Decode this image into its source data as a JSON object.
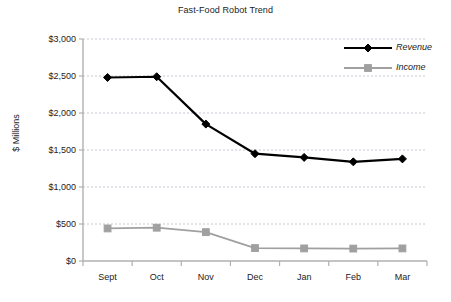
{
  "chart_data": {
    "type": "line",
    "title": "Fast-Food Robot Trend",
    "xlabel": "",
    "ylabel": "$ Millions",
    "categories": [
      "Sept",
      "Oct",
      "Nov",
      "Dec",
      "Jan",
      "Feb",
      "Mar"
    ],
    "series": [
      {
        "name": "Revenue",
        "values": [
          2480,
          2490,
          1850,
          1450,
          1400,
          1340,
          1380
        ],
        "color": "#000000",
        "marker": "diamond"
      },
      {
        "name": "Income",
        "values": [
          440,
          450,
          390,
          175,
          170,
          168,
          170
        ],
        "color": "#a0a0a0",
        "marker": "square"
      }
    ],
    "ylim": [
      0,
      3000
    ],
    "ytick_values": [
      0,
      500,
      1000,
      1500,
      2000,
      2500,
      3000
    ],
    "ytick_labels": [
      "$0",
      "$500",
      "$1,000",
      "$1,500",
      "$2,000",
      "$2,500",
      "$3,000"
    ],
    "grid": true,
    "grid_axis": "y",
    "grid_style": "dashed",
    "grid_color": "#c3c8d2",
    "legend_position": "top-right",
    "legend_entries": [
      "Revenue",
      "Income"
    ],
    "axis_color": "#b0b0b0",
    "background_color": "#ffffff"
  }
}
